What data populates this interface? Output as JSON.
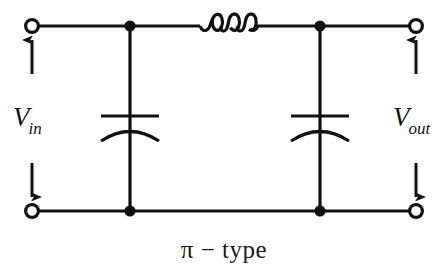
{
  "figure": {
    "caption": "π − type",
    "background_color": "#ffffff",
    "line_color": "#111111"
  },
  "labels": {
    "input": {
      "symbol": "V",
      "subscript": "in",
      "full": "V_in"
    },
    "output": {
      "symbol": "V",
      "subscript": "out",
      "full": "V_out"
    }
  },
  "circuit": {
    "type": "pi-type low-pass filter",
    "topology": "shunt capacitor – series inductor – shunt capacitor",
    "rails": {
      "top_y": 26,
      "bottom_y": 211,
      "left_x": 32,
      "right_x": 416
    },
    "terminals": [
      {
        "name": "input-top-terminal",
        "x": 32,
        "y": 26,
        "style": "open-circle"
      },
      {
        "name": "input-bottom-terminal",
        "x": 32,
        "y": 211,
        "style": "open-circle"
      },
      {
        "name": "output-top-terminal",
        "x": 416,
        "y": 26,
        "style": "open-circle"
      },
      {
        "name": "output-bottom-terminal",
        "x": 416,
        "y": 211,
        "style": "open-circle"
      }
    ],
    "junctions": [
      {
        "name": "node-c1-top",
        "x": 130,
        "y": 26
      },
      {
        "name": "node-c1-bottom",
        "x": 130,
        "y": 211
      },
      {
        "name": "node-c2-top",
        "x": 320,
        "y": 26
      },
      {
        "name": "node-c2-bottom",
        "x": 320,
        "y": 211
      }
    ],
    "components": [
      {
        "name": "shunt-capacitor-input",
        "kind": "capacitor",
        "orientation": "vertical",
        "x": 130,
        "plate_y": 116,
        "arc_y": 131,
        "plate_half_width": 29
      },
      {
        "name": "series-inductor",
        "kind": "inductor",
        "orientation": "horizontal",
        "x_start": 199,
        "x_end": 256,
        "y": 26,
        "coils": 3
      },
      {
        "name": "shunt-capacitor-output",
        "kind": "capacitor",
        "orientation": "vertical",
        "x": 320,
        "plate_y": 116,
        "arc_y": 131,
        "plate_half_width": 29
      }
    ],
    "arrows": [
      {
        "name": "input-voltage-arrow-up",
        "x": 32,
        "from_y": 74,
        "to_y": 36,
        "direction": "up"
      },
      {
        "name": "input-voltage-arrow-down",
        "x": 32,
        "from_y": 163,
        "to_y": 201,
        "direction": "down"
      },
      {
        "name": "output-voltage-arrow-up",
        "x": 416,
        "from_y": 74,
        "to_y": 36,
        "direction": "up"
      },
      {
        "name": "output-voltage-arrow-down",
        "x": 416,
        "from_y": 163,
        "to_y": 201,
        "direction": "down"
      }
    ]
  }
}
